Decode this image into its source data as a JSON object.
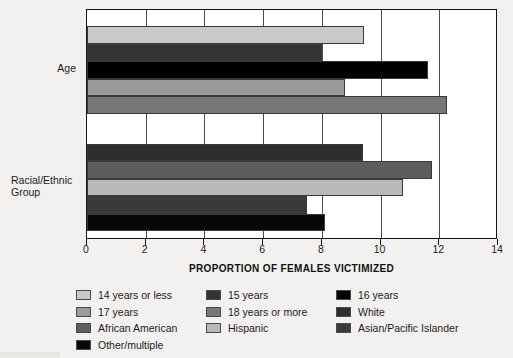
{
  "chart_data": {
    "type": "bar",
    "orientation": "horizontal",
    "title": "",
    "xlabel": "PROPORTION OF FEMALES VICTIMIZED",
    "ylabel": "",
    "xlim": [
      0,
      14
    ],
    "xticks": [
      0,
      2,
      4,
      6,
      8,
      10,
      12,
      14
    ],
    "xtick_labels": [
      "0",
      "2",
      "4",
      "6",
      "8",
      "10",
      "12",
      "14"
    ],
    "grid": "vertical",
    "legend_position": "bottom",
    "groups": [
      {
        "label": "Age",
        "bars": [
          {
            "name": "14 years or less",
            "value": 9.45,
            "color": "#c9c9c9"
          },
          {
            "name": "15 years",
            "value": 8.0,
            "color": "#333333"
          },
          {
            "name": "16 years",
            "value": 11.6,
            "color": "#000000"
          },
          {
            "name": "17 years",
            "value": 8.8,
            "color": "#9a9a9a"
          },
          {
            "name": "18 years or more",
            "value": 12.25,
            "color": "#777777"
          }
        ]
      },
      {
        "label": "Racial/Ethnic Group",
        "bars": [
          {
            "name": "White",
            "value": 9.4,
            "color": "#2e2e2e"
          },
          {
            "name": "African American",
            "value": 11.75,
            "color": "#5d5d5d"
          },
          {
            "name": "Hispanic",
            "value": 10.75,
            "color": "#b9b9b9"
          },
          {
            "name": "Asian/Pacific Islander",
            "value": 7.5,
            "color": "#3a3a3a"
          },
          {
            "name": "Other/multiple",
            "value": 8.1,
            "color": "#080808"
          }
        ]
      }
    ],
    "legend": [
      {
        "label": "14 years or less",
        "color": "#c9c9c9"
      },
      {
        "label": "15 years",
        "color": "#333333"
      },
      {
        "label": "16 years",
        "color": "#000000"
      },
      {
        "label": "17 years",
        "color": "#9a9a9a"
      },
      {
        "label": "18 years or more",
        "color": "#777777"
      },
      {
        "label": "White",
        "color": "#2e2e2e"
      },
      {
        "label": "African American",
        "color": "#5d5d5d"
      },
      {
        "label": "Hispanic",
        "color": "#b9b9b9"
      },
      {
        "label": "Asian/Pacific Islander",
        "color": "#3a3a3a"
      },
      {
        "label": "Other/multiple",
        "color": "#080808"
      }
    ]
  },
  "category_labels": {
    "age": "Age",
    "race_line1": "Racial/Ethnic",
    "race_line2": "Group"
  }
}
